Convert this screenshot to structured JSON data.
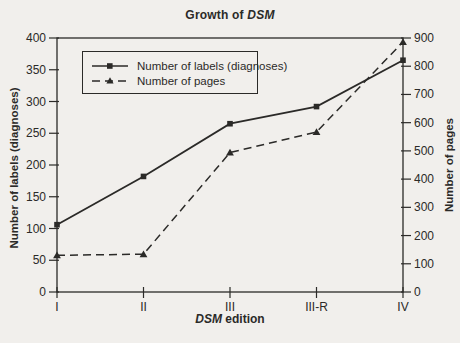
{
  "title": {
    "prefix": "Growth of ",
    "italic": "DSM"
  },
  "colors": {
    "background": "#f1efec",
    "ink": "#2b2a28"
  },
  "chart_data": {
    "type": "line",
    "categories": [
      "I",
      "II",
      "III",
      "III-R",
      "IV"
    ],
    "xlabel": {
      "italic": "DSM",
      "rest": " edition"
    },
    "left_axis": {
      "label": "Number of labels (diagnoses)",
      "min": 0,
      "max": 400,
      "ticks": [
        0,
        50,
        100,
        150,
        200,
        250,
        300,
        350,
        400
      ]
    },
    "right_axis": {
      "label": "Number of pages",
      "min": 0,
      "max": 900,
      "ticks": [
        0,
        100,
        200,
        300,
        400,
        500,
        600,
        700,
        800,
        900
      ]
    },
    "series": [
      {
        "name": "Number of labels (diagnoses)",
        "axis": "left",
        "style": "solid",
        "marker": "square",
        "values": [
          106,
          182,
          265,
          292,
          365
        ]
      },
      {
        "name": "Number of pages",
        "axis": "right",
        "style": "dashed",
        "marker": "triangle",
        "values": [
          130,
          134,
          494,
          567,
          886
        ]
      }
    ],
    "grid": false,
    "legend_position": "top-left-inside"
  }
}
